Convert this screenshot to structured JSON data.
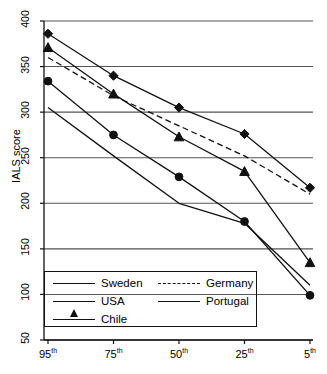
{
  "chart_data": {
    "type": "line",
    "title": "",
    "xlabel": "",
    "ylabel": "IALS score",
    "categories": [
      "95th",
      "75th",
      "50th",
      "25th",
      "5th"
    ],
    "category_bases": [
      "95",
      "75",
      "50",
      "25",
      "5"
    ],
    "category_suffix": "th",
    "ylim": [
      50,
      400
    ],
    "yticks": [
      50,
      100,
      150,
      200,
      250,
      300,
      350,
      400
    ],
    "grid": true,
    "legend_position": "lower-left-inside",
    "series": [
      {
        "name": "Sweden",
        "marker": "diamond",
        "style": "solid",
        "values": [
          386,
          340,
          305,
          276,
          217
        ]
      },
      {
        "name": "Germany",
        "marker": "none",
        "style": "dashed",
        "values": [
          360,
          318,
          285,
          252,
          210
        ]
      },
      {
        "name": "USA",
        "marker": "triangle",
        "style": "solid",
        "values": [
          371,
          320,
          273,
          235,
          135
        ]
      },
      {
        "name": "Portugal",
        "marker": "circle",
        "style": "solid",
        "values": [
          334,
          275,
          229,
          180,
          99
        ]
      },
      {
        "name": "Chile",
        "marker": "none",
        "style": "solid",
        "values": [
          305,
          252,
          200,
          178,
          110
        ]
      }
    ]
  },
  "axis": {
    "y_label": "IALS score",
    "y_ticks": [
      "400",
      "350",
      "300",
      "250",
      "200",
      "150",
      "100",
      "50"
    ],
    "x_ticks": [
      {
        "base": "95",
        "sup": "th"
      },
      {
        "base": "75",
        "sup": "th"
      },
      {
        "base": "50",
        "sup": "th"
      },
      {
        "base": "25",
        "sup": "th"
      },
      {
        "base": "5",
        "sup": "th"
      }
    ]
  },
  "legend": {
    "entries": [
      {
        "label": "Sweden",
        "marker": "diamond",
        "style": "solid"
      },
      {
        "label": "Germany",
        "marker": "none",
        "style": "dashed"
      },
      {
        "label": "USA",
        "marker": "triangle",
        "style": "solid"
      },
      {
        "label": "Portugal",
        "marker": "circle",
        "style": "solid"
      },
      {
        "label": "Chile",
        "marker": "none",
        "style": "solid"
      }
    ]
  },
  "colors": {
    "line": "#111111",
    "grid": "#555555",
    "axis": "#111111",
    "background": "#ffffff"
  }
}
